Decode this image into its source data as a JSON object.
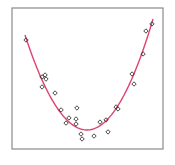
{
  "chart_data": {
    "type": "scatter",
    "title": "",
    "xlabel": "",
    "ylabel": "",
    "xlim": [
      0,
      100
    ],
    "ylim": [
      0,
      100
    ],
    "grid": false,
    "legend": null,
    "axes_ticks_visible": false,
    "series": [
      {
        "name": "observations",
        "kind": "scatter",
        "marker": "open-diamond",
        "color": "#333333",
        "points": [
          [
            9.3,
            77.3
          ],
          [
            19.9,
            51.1
          ],
          [
            21.9,
            52.5
          ],
          [
            22.5,
            49.6
          ],
          [
            19.9,
            44.0
          ],
          [
            28.5,
            39.7
          ],
          [
            32.5,
            27.7
          ],
          [
            37.7,
            22.0
          ],
          [
            35.8,
            18.4
          ],
          [
            43.0,
            29.1
          ],
          [
            42.4,
            21.3
          ],
          [
            42.4,
            17.7
          ],
          [
            45.7,
            10.6
          ],
          [
            46.4,
            7.1
          ],
          [
            54.3,
            9.2
          ],
          [
            58.3,
            19.1
          ],
          [
            62.3,
            20.6
          ],
          [
            63.6,
            12.1
          ],
          [
            68.9,
            29.8
          ],
          [
            70.2,
            28.4
          ],
          [
            80.8,
            46.1
          ],
          [
            79.5,
            53.2
          ],
          [
            86.8,
            67.4
          ],
          [
            88.7,
            83.7
          ],
          [
            92.7,
            88.7
          ]
        ]
      },
      {
        "name": "quadratic fit",
        "kind": "line",
        "color": "#e0426e",
        "x_range": [
          8.6,
          93.4
        ],
        "vertex": [
          49.7,
          13.5
        ],
        "endpoints": [
          [
            8.6,
            80.9
          ],
          [
            93.4,
            92.2
          ]
        ]
      }
    ]
  },
  "frame": {
    "left": 12,
    "top": 8,
    "right": 163,
    "bottom": 149,
    "border_color": "#8a8a8a"
  }
}
